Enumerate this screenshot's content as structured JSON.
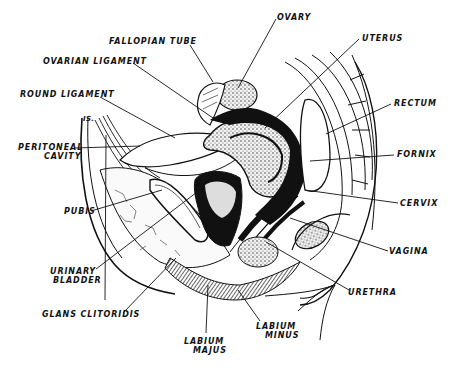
{
  "figure": {
    "type": "anatomical-illustration",
    "colors": {
      "ink": "#111111",
      "paper": "#ffffff"
    }
  },
  "labels": {
    "ovary": "OVARY",
    "fallopian_tube": "FALLOPIAN TUBE",
    "uterus": "UTERUS",
    "ovarian_ligament": "OVARIAN LIGAMENT",
    "round_ligament": "ROUND LIGAMENT",
    "rectum": "RECTUM",
    "is_mark": "IS.",
    "peritoneal_cavity": {
      "line1": "PERITONEAL",
      "line2": "CAVITY"
    },
    "fornix": "FORNIX",
    "pubis": "PUBIS",
    "cervix": "CERVIX",
    "vagina": "VAGINA",
    "urinary_bladder": {
      "line1": "URINARY",
      "line2": "BLADDER"
    },
    "urethra": "URETHRA",
    "glans_clitoridis": "GLANS CLITORIDIS",
    "labium_minus": {
      "line1": "LABIUM",
      "line2": "MINUS"
    },
    "labium_majus": {
      "line1": "LABIUM",
      "line2": "MAJUS"
    }
  }
}
